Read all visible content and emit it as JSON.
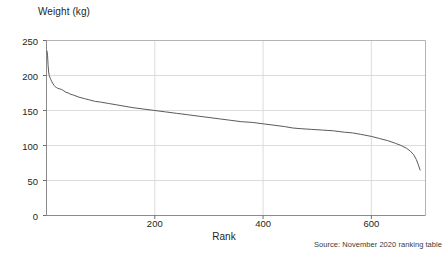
{
  "chart_data": {
    "type": "line",
    "title": "",
    "subtitle": "",
    "xlabel": "Rank",
    "ylabel": "Weight (kg)",
    "xlim": [
      0,
      700
    ],
    "ylim": [
      0,
      250
    ],
    "grid": true,
    "legend": null,
    "source_note": "Source: November 2020 ranking table",
    "y_ticks": [
      0,
      50,
      100,
      150,
      200,
      250
    ],
    "y_tick_labels": [
      "0",
      "50",
      "100",
      "150",
      "200",
      "250"
    ],
    "x_ticks": [
      200,
      400,
      600
    ],
    "x_tick_labels": [
      "200",
      "400",
      "600"
    ],
    "series": [
      {
        "name": "Weight by rank",
        "color": "#5a5a5a",
        "x": [
          1,
          2,
          3,
          4,
          5,
          6,
          7,
          8,
          10,
          12,
          14,
          16,
          18,
          20,
          24,
          28,
          32,
          36,
          40,
          45,
          50,
          60,
          70,
          80,
          90,
          100,
          115,
          130,
          145,
          160,
          180,
          200,
          220,
          240,
          260,
          280,
          300,
          320,
          340,
          360,
          380,
          400,
          420,
          440,
          455,
          470,
          490,
          510,
          530,
          550,
          565,
          580,
          600,
          615,
          630,
          645,
          655,
          665,
          672,
          678,
          683,
          687,
          690
        ],
        "y": [
          235,
          228,
          214,
          205,
          200,
          198,
          196,
          194,
          191,
          188,
          186,
          184,
          183,
          182,
          181,
          180,
          178,
          176,
          175,
          173,
          172,
          169,
          167,
          165,
          163,
          162,
          160,
          158,
          156,
          154,
          152,
          150,
          148,
          146,
          144,
          142,
          140,
          138,
          136,
          134,
          133,
          131,
          129,
          127,
          125,
          124,
          123,
          122,
          121,
          119,
          118,
          116,
          113,
          110,
          107,
          103,
          100,
          96,
          92,
          87,
          80,
          72,
          65
        ]
      }
    ]
  },
  "axis_titles": {
    "y": "Weight (kg)",
    "x": "Rank"
  },
  "footer": {
    "source": "Source: November 2020 ranking table"
  }
}
